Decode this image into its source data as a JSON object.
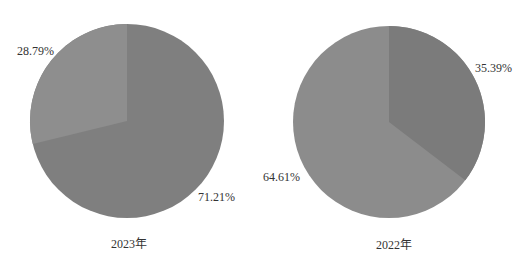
{
  "chart_data": [
    {
      "type": "pie",
      "title": "2023年",
      "slices": [
        {
          "label": "28.79%",
          "value": 28.79,
          "color": "#8e8e8e"
        },
        {
          "label": "71.21%",
          "value": 71.21,
          "color": "#7f7f7f"
        }
      ],
      "start_angle_deg": 0,
      "direction": "counterclockwise-first-slice",
      "legend": "none"
    },
    {
      "type": "pie",
      "title": "2022年",
      "slices": [
        {
          "label": "35.39%",
          "value": 35.39,
          "color": "#7b7b7b"
        },
        {
          "label": "64.61%",
          "value": 64.61,
          "color": "#8c8c8c"
        }
      ],
      "start_angle_deg": 0,
      "direction": "clockwise-first-slice",
      "legend": "none"
    }
  ],
  "charts": {
    "left": {
      "caption": "2023年",
      "small_label": "28.79%",
      "large_label": "71.21%"
    },
    "right": {
      "caption": "2022年",
      "small_label": "35.39%",
      "large_label": "64.61%"
    }
  }
}
